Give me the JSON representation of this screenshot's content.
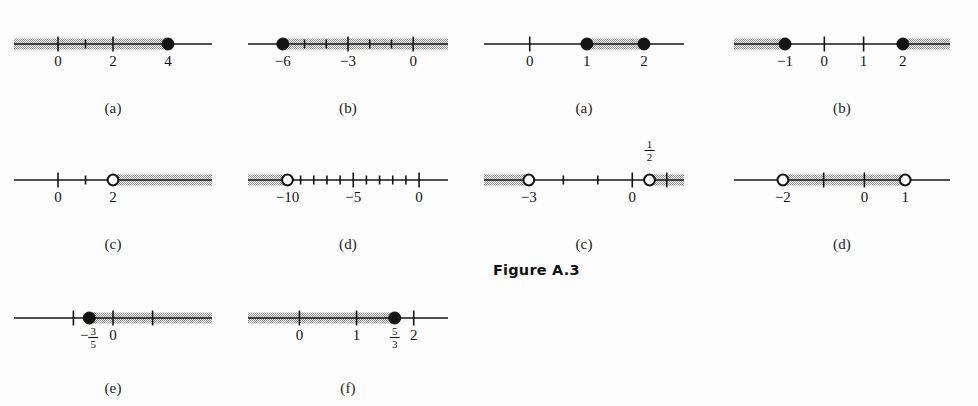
{
  "figure": {
    "label": "Figure A.3",
    "background_color": "#fdfdfd",
    "ink_color": "#141414",
    "shade_color": "#a0a0a0"
  },
  "groups": [
    {
      "name": "left-group",
      "panels": [
        {
          "id": "left-a",
          "caption": "(a)",
          "axis": {
            "min": -1.6,
            "max": 5.6
          },
          "ticks": [
            {
              "value": 0,
              "label": "0",
              "tall": true
            },
            {
              "value": 1,
              "label": "",
              "tall": false
            },
            {
              "value": 2,
              "label": "2",
              "tall": true
            }
          ],
          "endpoints": [
            {
              "value": 4,
              "label": "4",
              "type": "closed"
            }
          ],
          "bands": [
            {
              "from": -1.6,
              "to": 4,
              "cap_left": "arrow",
              "cap_right": "point"
            }
          ]
        },
        {
          "id": "left-b",
          "caption": "(b)",
          "axis": {
            "min": -7.6,
            "max": 1.6
          },
          "ticks": [
            {
              "value": -5,
              "label": "",
              "tall": false
            },
            {
              "value": -4,
              "label": "",
              "tall": false
            },
            {
              "value": -3,
              "label": "−3",
              "tall": true
            },
            {
              "value": -2,
              "label": "",
              "tall": false
            },
            {
              "value": -1,
              "label": "",
              "tall": false
            },
            {
              "value": 0,
              "label": "0",
              "tall": true
            }
          ],
          "endpoints": [
            {
              "value": -6,
              "label": "−6",
              "type": "closed"
            }
          ],
          "bands": [
            {
              "from": -6,
              "to": 1.6,
              "cap_left": "point",
              "cap_right": "arrow"
            }
          ]
        },
        {
          "id": "left-c",
          "caption": "(c)",
          "axis": {
            "min": -1.6,
            "max": 5.6
          },
          "ticks": [
            {
              "value": 0,
              "label": "0",
              "tall": true
            },
            {
              "value": 1,
              "label": "",
              "tall": false
            }
          ],
          "endpoints": [
            {
              "value": 2,
              "label": "2",
              "type": "open"
            }
          ],
          "bands": [
            {
              "from": 2,
              "to": 5.6,
              "cap_left": "point",
              "cap_right": "arrow"
            }
          ]
        },
        {
          "id": "left-d",
          "caption": "(d)",
          "axis": {
            "min": -13.0,
            "max": 2.2
          },
          "ticks": [
            {
              "value": -9,
              "label": "",
              "tall": false
            },
            {
              "value": -8,
              "label": "",
              "tall": false
            },
            {
              "value": -7,
              "label": "",
              "tall": false
            },
            {
              "value": -6,
              "label": "",
              "tall": false
            },
            {
              "value": -5,
              "label": "−5",
              "tall": true
            },
            {
              "value": -4,
              "label": "",
              "tall": false
            },
            {
              "value": -3,
              "label": "",
              "tall": false
            },
            {
              "value": -2,
              "label": "",
              "tall": false
            },
            {
              "value": -1,
              "label": "",
              "tall": false
            },
            {
              "value": 0,
              "label": "0",
              "tall": true
            }
          ],
          "endpoints": [
            {
              "value": -10,
              "label": "−10",
              "type": "open"
            }
          ],
          "bands": [
            {
              "from": -13.0,
              "to": -10,
              "cap_left": "arrow",
              "cap_right": "point"
            }
          ]
        },
        {
          "id": "left-e",
          "caption": "(e)",
          "axis": {
            "min": -2.5,
            "max": 2.5
          },
          "ticks": [
            {
              "value": -1,
              "label": "",
              "tall": true
            },
            {
              "value": 0,
              "label": "0",
              "tall": true
            },
            {
              "value": 1,
              "label": "",
              "tall": true
            }
          ],
          "endpoints": [
            {
              "value": -0.6,
              "label": "−3/5",
              "label_kind": "fraction",
              "frac": {
                "sign": "−",
                "num": "3",
                "den": "5"
              },
              "type": "closed"
            }
          ],
          "bands": [
            {
              "from": -0.6,
              "to": 2.5,
              "cap_left": "point",
              "cap_right": "arrow"
            }
          ]
        },
        {
          "id": "left-f",
          "caption": "(f)",
          "axis": {
            "min": -0.9,
            "max": 2.6
          },
          "ticks": [
            {
              "value": 0,
              "label": "0",
              "tall": true
            },
            {
              "value": 1,
              "label": "1",
              "tall": true
            },
            {
              "value": 2,
              "label": "2",
              "tall": true
            }
          ],
          "endpoints": [
            {
              "value": 1.6667,
              "label": "5/3",
              "label_kind": "fraction",
              "frac": {
                "sign": "",
                "num": "5",
                "den": "3"
              },
              "type": "closed"
            }
          ],
          "bands": [
            {
              "from": -0.9,
              "to": 1.6667,
              "cap_left": "arrow",
              "cap_right": "point"
            }
          ]
        }
      ]
    },
    {
      "name": "right-group",
      "panels": [
        {
          "id": "right-a",
          "caption": "(a)",
          "axis": {
            "min": -0.8,
            "max": 2.7
          },
          "ticks": [
            {
              "value": 0,
              "label": "0",
              "tall": true
            }
          ],
          "endpoints": [
            {
              "value": 1,
              "label": "1",
              "type": "closed"
            },
            {
              "value": 2,
              "label": "2",
              "type": "closed"
            }
          ],
          "bands": [
            {
              "from": 1,
              "to": 2,
              "cap_left": "point",
              "cap_right": "point"
            }
          ]
        },
        {
          "id": "right-b",
          "caption": "(b)",
          "axis": {
            "min": -2.3,
            "max": 3.2
          },
          "ticks": [
            {
              "value": 0,
              "label": "0",
              "tall": true
            },
            {
              "value": 1,
              "label": "1",
              "tall": true
            }
          ],
          "endpoints": [
            {
              "value": -1,
              "label": "−1",
              "type": "closed"
            },
            {
              "value": 2,
              "label": "2",
              "type": "closed"
            }
          ],
          "bands": [
            {
              "from": -2.3,
              "to": -1,
              "cap_left": "arrow",
              "cap_right": "point"
            },
            {
              "from": 2,
              "to": 3.2,
              "cap_left": "point",
              "cap_right": "arrow"
            }
          ]
        },
        {
          "id": "right-c",
          "caption": "(c)",
          "axis": {
            "min": -4.3,
            "max": 1.5
          },
          "ticks": [
            {
              "value": -2,
              "label": "",
              "tall": false
            },
            {
              "value": -1,
              "label": "",
              "tall": false
            },
            {
              "value": 0,
              "label": "0",
              "tall": true
            },
            {
              "value": 1,
              "label": "",
              "tall": true
            }
          ],
          "endpoints": [
            {
              "value": -3,
              "label": "−3",
              "type": "open"
            },
            {
              "value": 0.5,
              "label": "1/2",
              "label_kind": "fraction",
              "label_above": true,
              "frac": {
                "sign": "",
                "num": "1",
                "den": "2"
              },
              "type": "open"
            }
          ],
          "bands": [
            {
              "from": -4.3,
              "to": -3,
              "cap_left": "arrow",
              "cap_right": "point"
            },
            {
              "from": 0.5,
              "to": 1.5,
              "cap_left": "point",
              "cap_right": "arrow"
            }
          ]
        },
        {
          "id": "right-d",
          "caption": "(d)",
          "axis": {
            "min": -3.2,
            "max": 2.1
          },
          "ticks": [
            {
              "value": -1,
              "label": "",
              "tall": true
            },
            {
              "value": 0,
              "label": "0",
              "tall": true
            }
          ],
          "endpoints": [
            {
              "value": -2,
              "label": "−2",
              "type": "open"
            },
            {
              "value": 1,
              "label": "1",
              "type": "open"
            }
          ],
          "bands": [
            {
              "from": -2,
              "to": 1,
              "cap_left": "point",
              "cap_right": "point"
            }
          ]
        }
      ]
    }
  ]
}
